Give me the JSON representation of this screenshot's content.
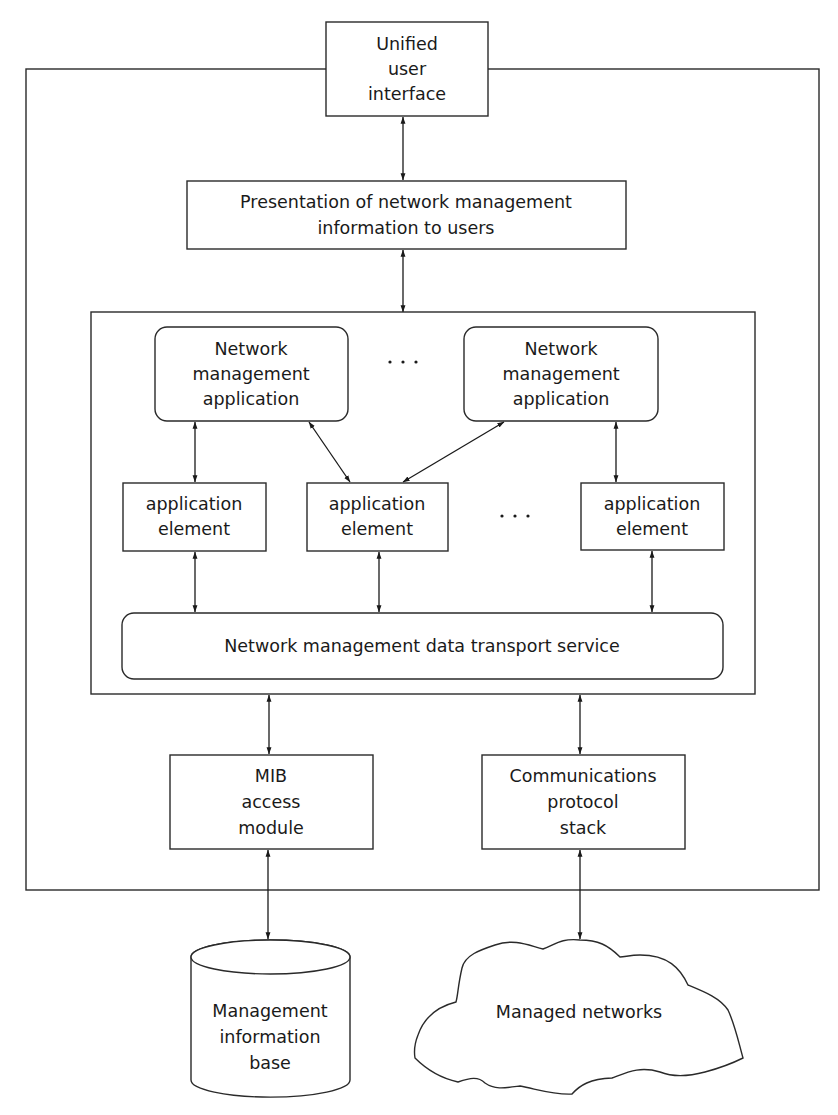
{
  "diagram": {
    "unified_ui": {
      "lines": [
        "Unified",
        "user",
        "interface"
      ]
    },
    "presentation": {
      "lines": [
        "Presentation of network management",
        "information to users"
      ]
    },
    "nm_app_1": {
      "lines": [
        "Network",
        "management",
        "application"
      ]
    },
    "nm_app_2": {
      "lines": [
        "Network",
        "management",
        "application"
      ]
    },
    "app_elem_1": {
      "lines": [
        "application",
        "element"
      ]
    },
    "app_elem_2": {
      "lines": [
        "application",
        "element"
      ]
    },
    "app_elem_3": {
      "lines": [
        "application",
        "element"
      ]
    },
    "ellipsis_apps": "· · ·",
    "ellipsis_elements": "· · ·",
    "transport": {
      "label": "Network management data transport service"
    },
    "mib_access": {
      "lines": [
        "MIB",
        "access",
        "module"
      ]
    },
    "comm_stack": {
      "lines": [
        "Communications",
        "protocol",
        "stack"
      ]
    },
    "mib": {
      "lines": [
        "Management",
        "information",
        "base"
      ]
    },
    "networks": {
      "label": "Managed networks"
    },
    "colors": {
      "stroke": "#2a2a2a",
      "background": "#ffffff",
      "text": "#1a1a1a"
    }
  }
}
